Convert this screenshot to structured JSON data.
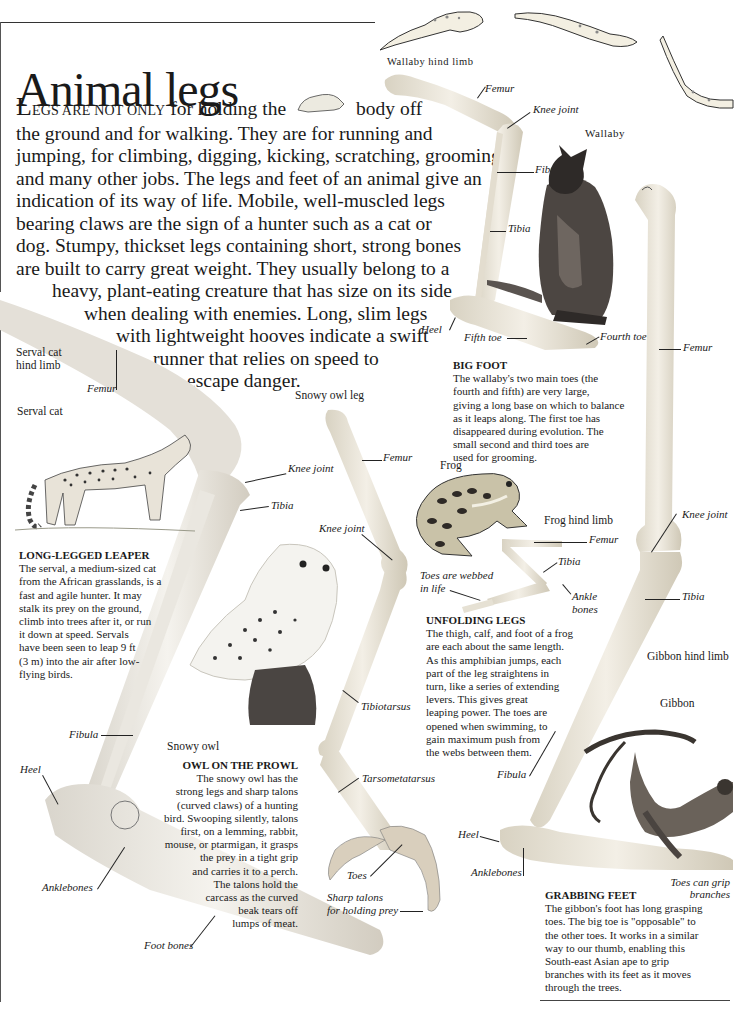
{
  "page": {
    "title": "Animal legs"
  },
  "intro": {
    "drop_cap": "L",
    "small_caps": "EGS ARE NOT ONLY",
    "lines": [
      " for holding the",
      "body off",
      "the ground and for walking. They are for running and",
      "jumping, for climbing, digging, kicking, scratching, grooming,",
      "and many other jobs. The legs and feet of an animal give an",
      "indication of its way of life. Mobile, well-muscled legs",
      "bearing claws are the sign of a hunter such as a cat or",
      "dog. Stumpy, thickset legs containing short, strong bones",
      "are built to carry great weight. They usually belong to a",
      "heavy, plant-eating creature that has size on its side",
      "when dealing with enemies. Long, slim legs",
      "with lightweight hooves indicate a swift",
      "runner that relies on speed to",
      "escape danger."
    ]
  },
  "wallaby": {
    "limb_heading": "Wallaby hind limb",
    "animal_label": "Wallaby",
    "bone_labels": {
      "femur": "Femur",
      "knee_joint": "Knee joint",
      "fibula": "Fibula",
      "tibia": "Tibia",
      "heel": "Heel",
      "fifth_toe": "Fifth toe",
      "fourth_toe": "Fourth toe"
    },
    "caption_title": "BIG FOOT",
    "caption_lines": [
      "The wallaby's two main toes (the",
      "fourth and fifth) are very large,",
      "giving a long base on which to balance",
      "as it leaps along. The first toe has",
      "disappeared during evolution. The",
      "small second and third toes are",
      "used for grooming."
    ]
  },
  "serval": {
    "limb_heading_lines": [
      "Serval cat",
      "hind limb"
    ],
    "animal_label": "Serval cat",
    "bone_labels": {
      "femur": "Femur",
      "knee_joint": "Knee joint",
      "tibia": "Tibia",
      "fibula": "Fibula",
      "heel": "Heel",
      "anklebones": "Anklebones",
      "foot_bones": "Foot bones"
    },
    "caption_title": "LONG-LEGGED LEAPER",
    "caption_lines": [
      "The serval, a medium-sized cat",
      "from the African grasslands, is a",
      "fast and agile hunter. It may",
      "stalk its prey on the ground,",
      "climb into trees after it, or run",
      "it down at speed. Servals",
      "have been seen to leap 9 ft",
      "(3 m) into the air after low-",
      "flying birds."
    ]
  },
  "owl": {
    "limb_heading": "Snowy owl leg",
    "animal_label": "Snowy owl",
    "bone_labels": {
      "femur": "Femur",
      "knee_joint": "Knee joint",
      "tibiotarsus": "Tibiotarsus",
      "tarsometatarsus": "Tarsometatarsus",
      "toes": "Toes",
      "talons_1": "Sharp talons",
      "talons_2": "for holding prey"
    },
    "caption_title": "OWL ON THE PROWL",
    "caption_lines": [
      "The snowy owl has the",
      "strong legs and sharp talons",
      "(curved claws) of a hunting",
      "bird. Swooping silently, talons",
      "first, on a lemming, rabbit,",
      "mouse, or ptarmigan, it grasps",
      "the prey in a tight grip",
      "and carries it to a perch.",
      "The talons hold the",
      "carcass as the curved",
      "beak tears off",
      "lumps of meat."
    ]
  },
  "frog": {
    "animal_label": "Frog",
    "limb_heading": "Frog hind limb",
    "bone_labels": {
      "femur": "Femur",
      "tibia": "Tibia",
      "ankle_1": "Ankle",
      "ankle_2": "bones",
      "webbed_1": "Toes are webbed",
      "webbed_2": "in life"
    },
    "caption_title": "UNFOLDING LEGS",
    "caption_lines": [
      "The thigh, calf, and foot of a frog",
      "are each about the same length.",
      "As this amphibian jumps, each",
      "part of the leg straightens in",
      "turn, like a series of extending",
      "levers. This gives great",
      "leaping power. The toes are",
      "opened when swimming, to",
      "gain maximum push from",
      "the webs between them."
    ]
  },
  "gibbon": {
    "limb_heading": "Gibbon hind limb",
    "animal_label": "Gibbon",
    "bone_labels": {
      "femur": "Femur",
      "knee_joint": "Knee joint",
      "tibia": "Tibia",
      "fibula": "Fibula",
      "heel": "Heel",
      "anklebones": "Anklebones",
      "toes_1": "Toes can grip",
      "toes_2": "branches"
    },
    "caption_title": "GRABBING FEET",
    "caption_lines": [
      "The gibbon's foot has long grasping",
      "toes. The big toe is \"opposable\" to",
      "the other toes. It works in a similar",
      "way to our thumb, enabling this",
      "South-east Asian ape to grip",
      "branches with its feet as it moves",
      "through the trees."
    ]
  },
  "colors": {
    "ink": "#1a1a1a",
    "bone": "#e9e4d6",
    "bone_shadow": "#c9c3b3",
    "wallaby_fur": "#4a4440",
    "rule": "#333333"
  }
}
